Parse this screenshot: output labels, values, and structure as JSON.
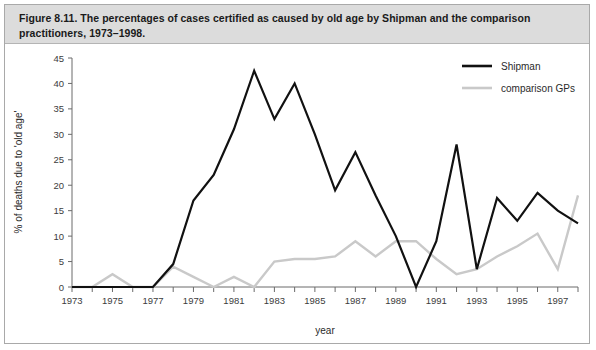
{
  "caption": {
    "text": "Figure 8.11. The percentages of cases certified as caused by old age by Shipman and the comparison practitioners, 1973–1998."
  },
  "axes": {
    "y_title": "% of deaths due to 'old age'",
    "x_title": "year",
    "y_ticks": [
      "0",
      "5",
      "10",
      "15",
      "20",
      "25",
      "30",
      "35",
      "40",
      "45"
    ],
    "x_ticks": [
      "1973",
      "1975",
      "1977",
      "1979",
      "1981",
      "1983",
      "1985",
      "1987",
      "1989",
      "1991",
      "1993",
      "1995",
      "1997"
    ]
  },
  "legend": {
    "items": [
      {
        "label": "Shipman",
        "color": "#111111"
      },
      {
        "label": "comparison GPs",
        "color": "#c9c9c9"
      }
    ]
  },
  "colors": {
    "shipman": "#111111",
    "comparison_gps": "#c9c9c9",
    "axis": "#6b6b6b",
    "caption_bg": "#dcdcdc",
    "frame": "#a9a9a9"
  },
  "chart_data": {
    "type": "line",
    "title": "The percentages of cases certified as caused by old age by Shipman and the comparison practitioners, 1973–1998",
    "xlabel": "year",
    "ylabel": "% of deaths due to 'old age'",
    "xlim": [
      1973,
      1998
    ],
    "ylim": [
      0,
      45
    ],
    "ytick_step": 5,
    "grid": false,
    "legend_position": "top-right",
    "x": [
      1973,
      1974,
      1975,
      1976,
      1977,
      1978,
      1979,
      1980,
      1981,
      1982,
      1983,
      1984,
      1985,
      1986,
      1987,
      1988,
      1989,
      1990,
      1991,
      1992,
      1993,
      1994,
      1995,
      1996,
      1997,
      1998
    ],
    "series": [
      {
        "name": "Shipman",
        "color": "#111111",
        "values": [
          0,
          0,
          0,
          0,
          0,
          4.5,
          17,
          22,
          31,
          42.5,
          33,
          40,
          30,
          19,
          26.5,
          18,
          10,
          0,
          9,
          28,
          3.5,
          17.5,
          13,
          18.5,
          15,
          12.5
        ]
      },
      {
        "name": "comparison GPs",
        "color": "#c9c9c9",
        "values": [
          0,
          0,
          2.5,
          0,
          0,
          4,
          2,
          0,
          2,
          0,
          5,
          5.5,
          5.5,
          6,
          9,
          6,
          9,
          9,
          5.5,
          2.5,
          3.5,
          6,
          8,
          10.5,
          3.5,
          18
        ]
      }
    ]
  }
}
